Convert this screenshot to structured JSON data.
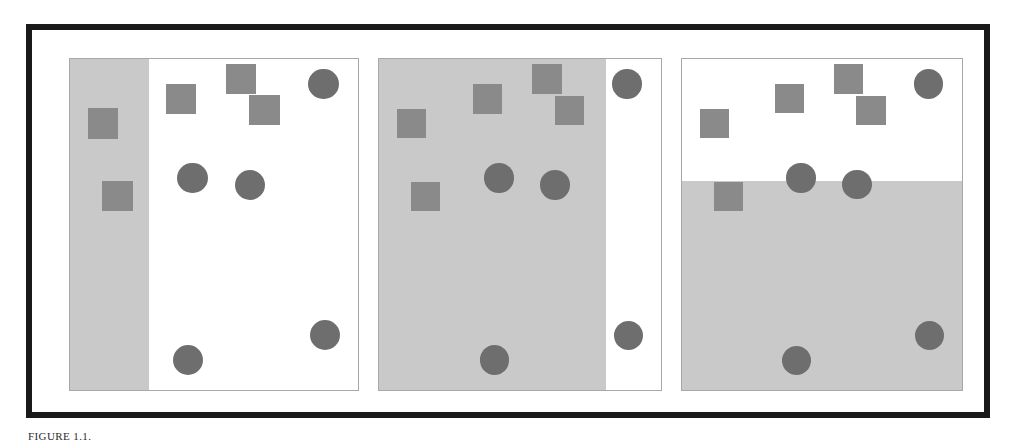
{
  "figure": {
    "kind": "classification-decision-boundary-illustration",
    "panel_count": 3,
    "colors": {
      "frame": "#1a1a1a",
      "panel_border": "#a8a8a8",
      "panel_background": "#ffffff",
      "shaded_region": "#c9c9c9",
      "square_marker": "#8a8a8a",
      "circle_marker": "#6e6e6e"
    }
  },
  "caption": {
    "label": "FIGURE 1.1.",
    "text": ""
  },
  "chart_data": {
    "type": "scatter",
    "title": "",
    "subtitle": "",
    "xlabel": "",
    "ylabel": "",
    "xlim": [
      0,
      1
    ],
    "ylim": [
      0,
      1
    ],
    "grid": false,
    "legend": null,
    "marker_size_square": 0.105,
    "marker_size_circle": 0.105,
    "classes": [
      {
        "name": "square",
        "shape": "square",
        "color": "#8a8a8a"
      },
      {
        "name": "circle",
        "shape": "circle",
        "color": "#6e6e6e"
      }
    ],
    "points": [
      {
        "id": "s1",
        "class": "square",
        "x": 0.115,
        "y": 0.805
      },
      {
        "id": "s2",
        "class": "square",
        "x": 0.385,
        "y": 0.88
      },
      {
        "id": "s3",
        "class": "square",
        "x": 0.595,
        "y": 0.94
      },
      {
        "id": "s4",
        "class": "square",
        "x": 0.675,
        "y": 0.845
      },
      {
        "id": "s5",
        "class": "square",
        "x": 0.165,
        "y": 0.585
      },
      {
        "id": "c1",
        "class": "circle",
        "x": 0.88,
        "y": 0.925
      },
      {
        "id": "c2",
        "class": "circle",
        "x": 0.425,
        "y": 0.64
      },
      {
        "id": "c3",
        "class": "circle",
        "x": 0.625,
        "y": 0.62
      },
      {
        "id": "c4",
        "class": "circle",
        "x": 0.885,
        "y": 0.165
      },
      {
        "id": "c5",
        "class": "circle",
        "x": 0.41,
        "y": 0.09
      }
    ],
    "panels": [
      {
        "index": 1,
        "name": "vertical-split-left",
        "boundary": {
          "orientation": "vertical",
          "position": 0.275
        },
        "shaded_side": "left",
        "shaded_fraction": 0.275
      },
      {
        "index": 2,
        "name": "vertical-split-right",
        "boundary": {
          "orientation": "vertical",
          "position": 0.805
        },
        "shaded_side": "left",
        "shaded_fraction": 0.805
      },
      {
        "index": 3,
        "name": "horizontal-split",
        "boundary": {
          "orientation": "horizontal",
          "position": 0.63
        },
        "shaded_side": "bottom",
        "shaded_fraction": 0.63
      }
    ]
  }
}
